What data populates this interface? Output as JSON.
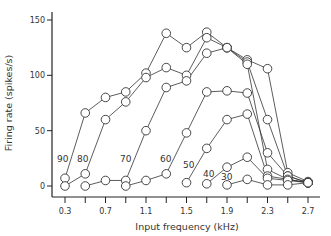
{
  "chart_data": {
    "type": "line",
    "title": "",
    "xlabel": "Input frequency (kHz)",
    "ylabel": "Firing rate (spikes/s)",
    "xlim": [
      0.3,
      2.7
    ],
    "ylim": [
      0,
      150
    ],
    "xticks": [
      0.3,
      0.5,
      0.7,
      0.9,
      1.1,
      1.3,
      1.5,
      1.7,
      1.9,
      2.1,
      2.3,
      2.5,
      2.7
    ],
    "xtick_labels": [
      "0.3",
      "",
      "0.7",
      "",
      "1.1",
      "",
      "1.5",
      "",
      "1.9",
      "",
      "2.3",
      "",
      "2.7"
    ],
    "yticks": [
      0,
      50,
      100,
      150
    ],
    "ytick_labels": [
      "0",
      "50",
      "100",
      "150"
    ],
    "grid": false,
    "legend": "inline-labels",
    "series": [
      {
        "name": "90",
        "label": "90",
        "x": [
          0.3,
          0.5,
          0.7,
          0.9,
          1.1,
          1.3,
          1.5,
          1.7,
          1.9,
          2.1,
          2.3,
          2.5,
          2.7
        ],
        "values": [
          7,
          66,
          80,
          85,
          102,
          138,
          125,
          139,
          125,
          114,
          106,
          12,
          4
        ]
      },
      {
        "name": "80",
        "label": "80",
        "x": [
          0.3,
          0.5,
          0.7,
          0.9,
          1.1,
          1.3,
          1.5,
          1.7,
          1.9,
          2.1,
          2.3,
          2.5,
          2.7
        ],
        "values": [
          0,
          11,
          60,
          76,
          98,
          107,
          100,
          134,
          125,
          112,
          60,
          9,
          3
        ]
      },
      {
        "name": "70",
        "label": "70",
        "x": [
          0.5,
          0.7,
          0.9,
          1.1,
          1.3,
          1.5,
          1.7,
          1.9,
          2.1,
          2.3,
          2.5,
          2.7
        ],
        "values": [
          0,
          5,
          5,
          50,
          89,
          95,
          120,
          125,
          110,
          15,
          6,
          3
        ]
      },
      {
        "name": "60",
        "label": "60",
        "x": [
          0.9,
          1.1,
          1.3,
          1.5,
          1.7,
          1.9,
          2.1,
          2.3,
          2.5,
          2.7
        ],
        "values": [
          0,
          5,
          11,
          48,
          85,
          86,
          84,
          30,
          9,
          3
        ]
      },
      {
        "name": "50",
        "label": "50",
        "x": [
          1.5,
          1.7,
          1.9,
          2.1,
          2.3,
          2.5,
          2.7
        ],
        "values": [
          3,
          34,
          60,
          65,
          9,
          6,
          3
        ]
      },
      {
        "name": "40",
        "label": "40",
        "x": [
          1.7,
          1.9,
          2.1,
          2.3,
          2.5,
          2.7
        ],
        "values": [
          2,
          17,
          26,
          7,
          5,
          3
        ]
      },
      {
        "name": "30",
        "label": "30",
        "x": [
          1.9,
          2.1,
          2.3,
          2.5,
          2.7
        ],
        "values": [
          1,
          6,
          1,
          1,
          3
        ]
      }
    ]
  }
}
